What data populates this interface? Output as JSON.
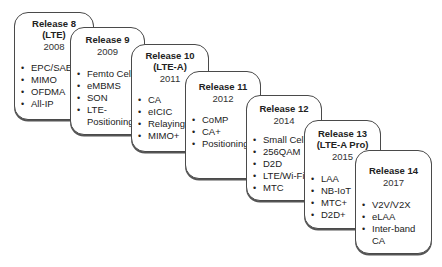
{
  "diagram": {
    "bullet_glyph": "•",
    "releases": [
      {
        "title": "Release 8",
        "subtitle": "(LTE)",
        "year": "2008",
        "features": [
          "EPC/SAE",
          "MIMO",
          "OFDMA",
          "All-IP"
        ]
      },
      {
        "title": "Release 9",
        "subtitle": "",
        "year": "2009",
        "features": [
          "Femto Cell",
          "eMBMS",
          "SON",
          "LTE-\nPositioning"
        ]
      },
      {
        "title": "Release 10",
        "subtitle": "(LTE-A)",
        "year": "2011",
        "features": [
          "CA",
          "eICIC",
          "Relaying",
          "MIMO+"
        ]
      },
      {
        "title": "Release 11",
        "subtitle": "",
        "year": "2012",
        "features": [
          "CoMP",
          "CA+",
          "Positioning"
        ]
      },
      {
        "title": "Release 12",
        "subtitle": "",
        "year": "2014",
        "features": [
          "Small Cell",
          "256QAM",
          "D2D",
          "LTE/Wi-Fi",
          "MTC"
        ]
      },
      {
        "title": "Release 13",
        "subtitle": "(LTE-A Pro)",
        "year": "2015",
        "features": [
          "LAA",
          "NB-IoT",
          "MTC+",
          "D2D+"
        ]
      },
      {
        "title": "Release 14",
        "subtitle": "",
        "year": "2017",
        "features": [
          "V2V/V2X",
          "eLAA",
          "Inter-band CA"
        ]
      }
    ]
  }
}
